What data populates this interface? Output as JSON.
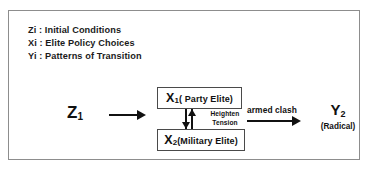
{
  "diagram": {
    "legend": [
      "Zi : Initial Conditions",
      "Xi : Elite Policy Choices",
      "Yi : Patterns of Transition"
    ],
    "initial_condition": {
      "symbol": "Z",
      "subscript": "1"
    },
    "elite_boxes": [
      {
        "symbol": "X",
        "subscript": "1",
        "label": "( Party Elite)"
      },
      {
        "symbol": "X",
        "subscript": "2",
        "label": "(Military Elite)"
      }
    ],
    "tension_label": {
      "line1": "Heighten",
      "line2": "Tension"
    },
    "transition_label": "armed clash",
    "outcome": {
      "symbol": "Y",
      "subscript": "2",
      "label": "(Radical)"
    },
    "colors": {
      "ink": "#111111",
      "frame": "#8d8d8d",
      "box_border": "#4a4a4a",
      "background": "#ffffff"
    },
    "icons": {
      "flow_arrow": "right-arrow-icon",
      "transition_arrow": "right-arrow-icon",
      "tension_down": "down-arrow-icon",
      "tension_up": "up-arrow-icon"
    }
  }
}
